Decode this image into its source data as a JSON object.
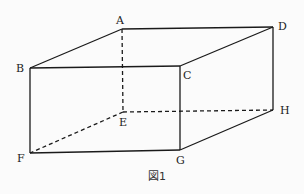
{
  "figure": {
    "caption": "図1",
    "vertices": {
      "A": {
        "label": "A",
        "x": 122,
        "y": 29
      },
      "B": {
        "label": "B",
        "x": 30,
        "y": 68
      },
      "C": {
        "label": "C",
        "x": 180,
        "y": 66
      },
      "D": {
        "label": "D",
        "x": 273,
        "y": 27
      },
      "E": {
        "label": "E",
        "x": 123,
        "y": 112
      },
      "F": {
        "label": "F",
        "x": 30,
        "y": 153
      },
      "G": {
        "label": "G",
        "x": 180,
        "y": 150
      },
      "H": {
        "label": "H",
        "x": 273,
        "y": 110
      }
    },
    "solid_edges": [
      "AB",
      "AD",
      "BC",
      "CD",
      "BF",
      "CG",
      "DH",
      "FG",
      "GH"
    ],
    "hidden_edges": [
      "AE",
      "EF",
      "EH"
    ]
  }
}
